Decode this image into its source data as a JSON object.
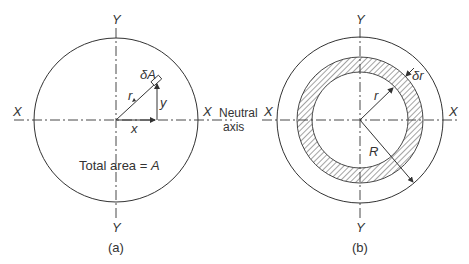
{
  "figure_a": {
    "caption": "(a)",
    "axis_y_top": "Y",
    "axis_y_bottom": "Y",
    "axis_x_left": "X",
    "axis_x_right": "X",
    "element_label": "δA",
    "radius_label": "r",
    "x_label": "x",
    "y_label": "y",
    "total_area_text": "Total area = ",
    "total_area_symbol": "A"
  },
  "neutral_axis": {
    "line1": "Neutral",
    "line2": "axis"
  },
  "figure_b": {
    "caption": "(b)",
    "axis_y_top": "Y",
    "axis_y_bottom": "Y",
    "axis_x_left": "X",
    "axis_x_right": "X",
    "thickness_label": "δr",
    "inner_radius_label": "r",
    "outer_radius_label": "R"
  },
  "colors": {
    "line": "#333333",
    "hatch": "#555555",
    "background": "#ffffff"
  }
}
